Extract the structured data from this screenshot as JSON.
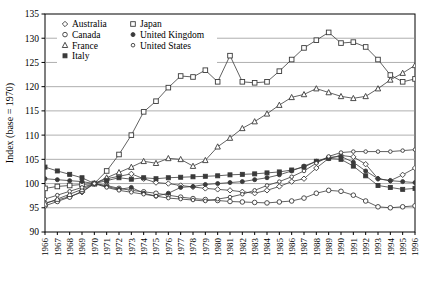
{
  "chart_data": {
    "type": "line",
    "title": "",
    "xlabel": "",
    "ylabel": "Index (base = 1970)",
    "ylim": [
      90,
      135
    ],
    "yticks": [
      90,
      95,
      100,
      105,
      110,
      115,
      120,
      125,
      130,
      135
    ],
    "grid": true,
    "legend_position": "top-left",
    "x": [
      1966,
      1967,
      1968,
      1969,
      1970,
      1971,
      1972,
      1973,
      1974,
      1975,
      1976,
      1977,
      1978,
      1979,
      1980,
      1981,
      1982,
      1983,
      1984,
      1985,
      1986,
      1987,
      1988,
      1989,
      1990,
      1991,
      1992,
      1993,
      1994,
      1995,
      1996
    ],
    "xticklabels": [
      "1966",
      "1967",
      "1968",
      "1969",
      "1970",
      "1971",
      "1972",
      "1973",
      "1974",
      "1975",
      "1976",
      "1977",
      "1978",
      "1979",
      "1980",
      "1981",
      "1982",
      "1983",
      "1984",
      "1985",
      "1986",
      "1987",
      "1988",
      "1989",
      "1990",
      "1991",
      "1992",
      "1993",
      "1994",
      "1995",
      "1996"
    ],
    "series": [
      {
        "name": "Australia",
        "marker": "diamond",
        "values": [
          96.0,
          96.6,
          97.3,
          98.2,
          100.0,
          101.0,
          101.5,
          102.0,
          101.0,
          100.2,
          100.0,
          99.6,
          99.3,
          99.0,
          98.8,
          98.6,
          98.3,
          98.0,
          98.6,
          99.4,
          100.4,
          101.0,
          103.2,
          105.2,
          105.8,
          105.5,
          104.0,
          101.0,
          100.6,
          101.8,
          103.2
        ]
      },
      {
        "name": "Canada",
        "marker": "circle-open",
        "values": [
          95.4,
          96.3,
          97.2,
          98.4,
          100.0,
          99.6,
          99.0,
          98.6,
          98.3,
          98.0,
          97.6,
          97.2,
          96.9,
          96.7,
          96.5,
          96.3,
          96.2,
          96.1,
          96.0,
          96.2,
          96.4,
          97.0,
          98.0,
          98.6,
          98.4,
          97.6,
          96.4,
          95.2,
          95.0,
          95.2,
          95.4
        ]
      },
      {
        "name": "France",
        "marker": "triangle",
        "values": [
          95.8,
          96.8,
          97.8,
          98.8,
          100.0,
          101.2,
          102.3,
          103.4,
          104.6,
          104.2,
          105.2,
          105.0,
          103.6,
          104.8,
          107.6,
          109.4,
          111.4,
          112.8,
          114.4,
          116.2,
          117.8,
          118.4,
          119.6,
          118.8,
          118.0,
          117.6,
          118.0,
          119.6,
          121.4,
          122.8,
          124.4
        ]
      },
      {
        "name": "Italy",
        "marker": "square-filled",
        "values": [
          103.4,
          102.6,
          101.9,
          101.2,
          100.0,
          100.6,
          101.2,
          100.9,
          101.2,
          101.0,
          101.2,
          101.3,
          101.4,
          101.5,
          101.6,
          101.8,
          101.9,
          102.0,
          102.2,
          102.4,
          102.8,
          103.4,
          104.6,
          105.2,
          105.0,
          103.6,
          101.6,
          99.6,
          99.2,
          98.8,
          99.0
        ]
      },
      {
        "name": "Japan",
        "marker": "square-open",
        "values": [
          99.0,
          99.4,
          99.6,
          99.8,
          100.0,
          102.6,
          106.0,
          110.0,
          114.8,
          117.0,
          119.8,
          122.2,
          122.0,
          123.4,
          121.0,
          126.4,
          121.0,
          120.8,
          121.0,
          123.2,
          125.6,
          128.0,
          129.6,
          131.2,
          129.0,
          129.2,
          128.2,
          125.6,
          122.4,
          121.0,
          121.6
        ]
      },
      {
        "name": "United Kingdom",
        "marker": "circle-filled",
        "values": [
          101.0,
          100.8,
          100.6,
          100.4,
          100.0,
          99.4,
          98.8,
          99.2,
          98.0,
          97.4,
          98.0,
          99.2,
          99.4,
          99.8,
          100.0,
          100.2,
          100.4,
          100.8,
          101.2,
          101.8,
          102.6,
          103.6,
          104.6,
          105.4,
          105.6,
          104.4,
          102.6,
          101.0,
          100.6,
          100.4,
          100.2
        ]
      },
      {
        "name": "United States",
        "marker": "circle-small-open",
        "values": [
          96.8,
          97.6,
          98.4,
          99.2,
          100.0,
          99.2,
          98.6,
          98.2,
          97.8,
          97.4,
          97.0,
          96.8,
          96.6,
          96.4,
          96.8,
          97.2,
          97.8,
          98.6,
          99.6,
          100.4,
          101.4,
          102.6,
          104.2,
          105.6,
          106.4,
          106.6,
          106.6,
          106.6,
          106.6,
          106.8,
          107.0
        ]
      }
    ]
  },
  "legend": {
    "entries": [
      {
        "label": "Australia"
      },
      {
        "label": "Canada"
      },
      {
        "label": "France"
      },
      {
        "label": "Italy"
      },
      {
        "label": "Japan"
      },
      {
        "label": "United Kingdom"
      },
      {
        "label": "United States"
      }
    ]
  },
  "colors": {
    "line": "#3a3a3a",
    "grid": "#8c8c8c",
    "axis": "#000000",
    "background": "#ffffff"
  }
}
